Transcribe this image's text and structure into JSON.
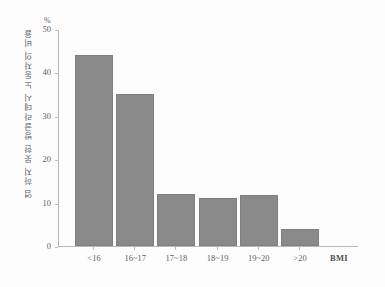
{
  "chart_data": {
    "type": "bar",
    "title": "",
    "categories": [
      "<16",
      "16~17",
      "17~18",
      "18~19",
      "19~20",
      ">20"
    ],
    "values": [
      44,
      35,
      12,
      11,
      11.7,
      4
    ],
    "xlabel": "BMI",
    "ylabel": "염 하지 못한 방글라데시 노동자의 비율",
    "yunit": "%",
    "ylim": [
      0,
      50
    ],
    "yticks": [
      0,
      10,
      20,
      30,
      40,
      50
    ],
    "ytick_labels": [
      "0",
      "10",
      "20",
      "30",
      "40",
      "50"
    ],
    "grid": false,
    "legend": "none",
    "bar_color": "#8a8a8a",
    "axis_color": "#b9b9b9",
    "text_color": "#5d5d5d"
  }
}
